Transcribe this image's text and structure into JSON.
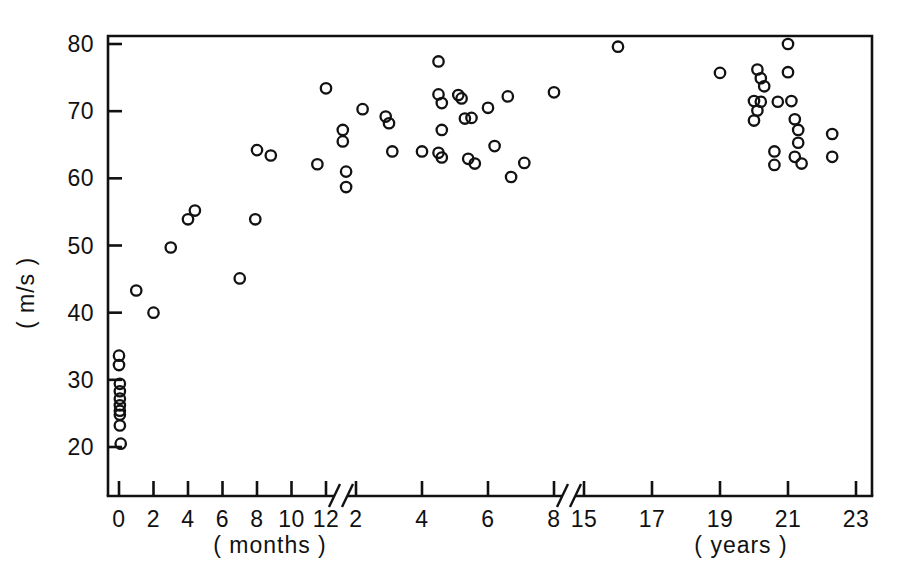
{
  "chart_data": {
    "type": "scatter",
    "title": "",
    "subtitle": "",
    "xlabel_left": "( months )",
    "xlabel_right": "( years )",
    "ylabel": "( m/s )",
    "grid": false,
    "legend": "none",
    "ylim": [
      14,
      82
    ],
    "yticks": [
      20,
      30,
      40,
      50,
      60,
      70,
      80
    ],
    "ytick_labels": [
      "20",
      "30",
      "40",
      "50",
      "60",
      "70",
      "80"
    ],
    "x_axis_note": "Broken axis: months segment 0-12, then years segment 2-8, then break, then years 15-23",
    "x_segments": [
      {
        "name": "months",
        "unit": "months",
        "ticks": [
          0,
          2,
          4,
          6,
          8,
          10,
          12
        ],
        "tick_labels": [
          "0",
          "2",
          "4",
          "6",
          "8",
          "10",
          "12"
        ]
      },
      {
        "name": "years-early",
        "unit": "years",
        "ticks": [
          2,
          4,
          6,
          8
        ],
        "tick_labels": [
          "2",
          "4",
          "6",
          "8"
        ]
      },
      {
        "name": "years-late",
        "unit": "years",
        "ticks": [
          15,
          17,
          19,
          21,
          23
        ],
        "tick_labels": [
          "15",
          "17",
          "19",
          "21",
          "23"
        ]
      }
    ],
    "axis_breaks": [
      {
        "after_label": "12",
        "before_label": "2"
      },
      {
        "after_label": "8",
        "before_label": "15"
      }
    ],
    "series": [
      {
        "name": "conduction velocity",
        "marker": "open-circle",
        "color": "#121212",
        "points": [
          {
            "seg": 0,
            "x": 0.0,
            "y": 33.6
          },
          {
            "seg": 0,
            "x": 0.0,
            "y": 32.2
          },
          {
            "seg": 0,
            "x": 0.05,
            "y": 29.4
          },
          {
            "seg": 0,
            "x": 0.05,
            "y": 28.3
          },
          {
            "seg": 0,
            "x": 0.05,
            "y": 27.2
          },
          {
            "seg": 0,
            "x": 0.05,
            "y": 26.2
          },
          {
            "seg": 0,
            "x": 0.05,
            "y": 25.4
          },
          {
            "seg": 0,
            "x": 0.05,
            "y": 24.8
          },
          {
            "seg": 0,
            "x": 0.05,
            "y": 23.2
          },
          {
            "seg": 0,
            "x": 0.1,
            "y": 20.5
          },
          {
            "seg": 0,
            "x": 1.0,
            "y": 43.3
          },
          {
            "seg": 0,
            "x": 2.0,
            "y": 40.0
          },
          {
            "seg": 0,
            "x": 3.0,
            "y": 49.7
          },
          {
            "seg": 0,
            "x": 4.0,
            "y": 53.9
          },
          {
            "seg": 0,
            "x": 4.4,
            "y": 55.2
          },
          {
            "seg": 0,
            "x": 7.0,
            "y": 45.1
          },
          {
            "seg": 0,
            "x": 7.9,
            "y": 53.9
          },
          {
            "seg": 0,
            "x": 8.0,
            "y": 64.2
          },
          {
            "seg": 0,
            "x": 8.8,
            "y": 63.4
          },
          {
            "seg": 0,
            "x": 11.5,
            "y": 62.1
          },
          {
            "seg": 0,
            "x": 12.0,
            "y": 73.4
          },
          {
            "seg": 1,
            "x": 1.6,
            "y": 67.2
          },
          {
            "seg": 1,
            "x": 1.6,
            "y": 65.5
          },
          {
            "seg": 1,
            "x": 1.7,
            "y": 61.0
          },
          {
            "seg": 1,
            "x": 1.7,
            "y": 58.7
          },
          {
            "seg": 1,
            "x": 2.2,
            "y": 70.3
          },
          {
            "seg": 1,
            "x": 2.9,
            "y": 69.2
          },
          {
            "seg": 1,
            "x": 3.0,
            "y": 68.2
          },
          {
            "seg": 1,
            "x": 3.1,
            "y": 64.0
          },
          {
            "seg": 1,
            "x": 4.0,
            "y": 64.0
          },
          {
            "seg": 1,
            "x": 4.5,
            "y": 77.4
          },
          {
            "seg": 1,
            "x": 4.5,
            "y": 72.5
          },
          {
            "seg": 1,
            "x": 4.6,
            "y": 71.2
          },
          {
            "seg": 1,
            "x": 4.6,
            "y": 67.2
          },
          {
            "seg": 1,
            "x": 4.5,
            "y": 63.8
          },
          {
            "seg": 1,
            "x": 4.6,
            "y": 63.1
          },
          {
            "seg": 1,
            "x": 5.1,
            "y": 72.4
          },
          {
            "seg": 1,
            "x": 5.2,
            "y": 71.9
          },
          {
            "seg": 1,
            "x": 5.3,
            "y": 68.9
          },
          {
            "seg": 1,
            "x": 5.5,
            "y": 69.0
          },
          {
            "seg": 1,
            "x": 5.4,
            "y": 62.9
          },
          {
            "seg": 1,
            "x": 5.6,
            "y": 62.2
          },
          {
            "seg": 1,
            "x": 6.0,
            "y": 70.5
          },
          {
            "seg": 1,
            "x": 6.2,
            "y": 64.8
          },
          {
            "seg": 1,
            "x": 6.6,
            "y": 72.2
          },
          {
            "seg": 1,
            "x": 6.7,
            "y": 60.2
          },
          {
            "seg": 1,
            "x": 7.1,
            "y": 62.3
          },
          {
            "seg": 1,
            "x": 8.0,
            "y": 72.8
          },
          {
            "seg": 2,
            "x": 16.0,
            "y": 79.6
          },
          {
            "seg": 2,
            "x": 19.0,
            "y": 75.7
          },
          {
            "seg": 2,
            "x": 20.1,
            "y": 76.2
          },
          {
            "seg": 2,
            "x": 20.2,
            "y": 74.9
          },
          {
            "seg": 2,
            "x": 20.3,
            "y": 73.7
          },
          {
            "seg": 2,
            "x": 20.0,
            "y": 71.5
          },
          {
            "seg": 2,
            "x": 20.2,
            "y": 71.4
          },
          {
            "seg": 2,
            "x": 20.1,
            "y": 70.1
          },
          {
            "seg": 2,
            "x": 20.0,
            "y": 68.6
          },
          {
            "seg": 2,
            "x": 20.7,
            "y": 71.4
          },
          {
            "seg": 2,
            "x": 20.6,
            "y": 64.0
          },
          {
            "seg": 2,
            "x": 20.6,
            "y": 62.0
          },
          {
            "seg": 2,
            "x": 21.0,
            "y": 80.0
          },
          {
            "seg": 2,
            "x": 21.0,
            "y": 75.8
          },
          {
            "seg": 2,
            "x": 21.1,
            "y": 71.5
          },
          {
            "seg": 2,
            "x": 21.2,
            "y": 68.8
          },
          {
            "seg": 2,
            "x": 21.3,
            "y": 67.2
          },
          {
            "seg": 2,
            "x": 21.3,
            "y": 65.3
          },
          {
            "seg": 2,
            "x": 21.2,
            "y": 63.2
          },
          {
            "seg": 2,
            "x": 21.4,
            "y": 62.2
          },
          {
            "seg": 2,
            "x": 22.3,
            "y": 66.6
          },
          {
            "seg": 2,
            "x": 22.3,
            "y": 63.2
          }
        ]
      }
    ]
  }
}
